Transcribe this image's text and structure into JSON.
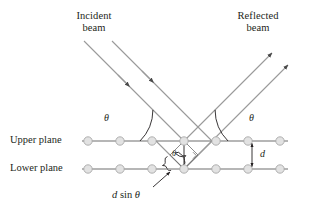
{
  "figure": {
    "background_color": "#ffffff",
    "ink_color": "#231f20",
    "ray_color": "#9a9a9a",
    "plane_color": "#6e6e6e",
    "atom_fill": "#e2e2e2",
    "atom_stroke": "#a8a8a8"
  },
  "labels": {
    "incident_beam_line1": "Incident",
    "incident_beam_line2": "beam",
    "reflected_beam_line1": "Reflected",
    "reflected_beam_line2": "beam",
    "upper_plane": "Upper plane",
    "lower_plane": "Lower plane",
    "theta_incident": "θ",
    "theta_reflected": "θ",
    "theta_interior": "θ",
    "spacing_d": "d",
    "path_difference_var": "d",
    "path_difference_fn": "sin",
    "path_difference_angle": "θ",
    "path_difference_full": "d sin θ"
  },
  "geometry": {
    "upper_plane_y": 141,
    "lower_plane_y": 169,
    "plane_x_start": 82,
    "plane_x_end": 288,
    "atom_x_positions": [
      88,
      120,
      152,
      184,
      216,
      248,
      280
    ],
    "atom_radius": 4.2,
    "interaction_vertex_upper_x": 184,
    "interaction_vertex_lower_x": 184,
    "ray_angle_degrees": 45,
    "d_arrow_x": 252,
    "theta_incident_label_pos": [
      107,
      115
    ],
    "theta_reflected_label_pos": [
      251,
      115
    ],
    "theta_interior_label_pos": [
      170,
      149
    ],
    "d_label_pos": [
      261,
      149
    ],
    "dsin_label_pos": [
      140,
      190
    ]
  },
  "chart_data": {
    "type": "diagram",
    "planes": [
      {
        "name": "Upper plane",
        "y": 141,
        "atom_count": 7
      },
      {
        "name": "Lower plane",
        "y": 169,
        "atom_count": 7
      }
    ],
    "angles": [
      {
        "name": "theta_incident",
        "value_symbol": "θ",
        "between": [
          "upper plane",
          "incident ray"
        ]
      },
      {
        "name": "theta_reflected",
        "value_symbol": "θ",
        "between": [
          "upper plane",
          "reflected ray"
        ]
      },
      {
        "name": "theta_interior",
        "value_symbol": "θ",
        "between": [
          "normal to planes",
          "incident ray"
        ]
      }
    ],
    "lengths": [
      {
        "name": "d",
        "meaning": "interplanar spacing"
      },
      {
        "name": "d sin θ",
        "meaning": "extra path length per plane"
      }
    ]
  }
}
